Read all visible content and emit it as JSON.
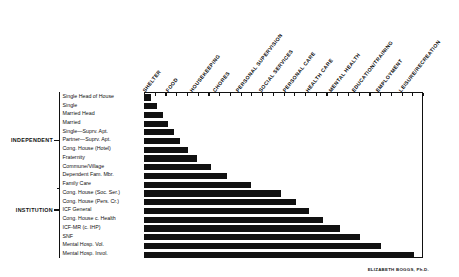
{
  "figure": {
    "credit": "ELIZABETH BOGGS, Ph.D."
  },
  "groups": [
    {
      "label": "INDEPENDENT",
      "first_row": 0,
      "last_row": 10
    },
    {
      "label": "INSTITUTION",
      "first_row": 11,
      "last_row": 15
    }
  ],
  "chart_data": {
    "type": "bar",
    "orientation": "horizontal",
    "xlabel": "",
    "ylabel": "",
    "grid": false,
    "legend": null,
    "axis_top_ticks": 26,
    "xlim": [
      0,
      12
    ],
    "columns": [
      "SHELTER",
      "FOOD",
      "HOUSEKEEPING",
      "CHORES",
      "PERSONAL SUPERVISION",
      "SOCIAL SERVICES",
      "PERSONAL CARE",
      "HEALTH CARE",
      "MENTAL HEALTH",
      "EDUCATION/TRAINING",
      "EMPLOYMENT",
      "LEISURE/RECREATION"
    ],
    "categories": [
      "Single Head of House",
      "Single",
      "Married Head",
      "Married",
      "Single—Suprv. Apt.",
      "Partner—Suprv. Apt.",
      "Cong. House (Hotel)",
      "Fraternity",
      "Commune/Village",
      "Dependent Fam. Mbr.",
      "Family Care",
      "Cong. House (Soc. Ser.)",
      "Cong. House (Pers. Cr.)",
      "ICF General",
      "Cong. House c. Health",
      "ICF-MR (c. IHP)",
      "SNF",
      "Mental Hosp. Vol.",
      "Mental Hosp. Invol."
    ],
    "values": [
      0.3,
      0.58,
      0.82,
      1.05,
      1.3,
      1.55,
      1.9,
      2.3,
      2.9,
      3.55,
      4.6,
      5.9,
      6.55,
      7.1,
      7.7,
      8.45,
      9.3,
      10.2,
      11.6
    ],
    "value_units": "service-columns covered (0 = none, 12 = all)"
  }
}
